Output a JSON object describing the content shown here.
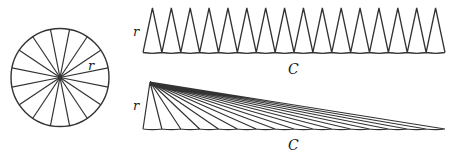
{
  "diagram": {
    "colors": {
      "stroke": "#333333",
      "background": "#ffffff",
      "label": "#222222"
    },
    "circle": {
      "sector_count": 16,
      "radius_label": "r"
    },
    "unrolled_sectors": {
      "sector_count": 16,
      "height_label": "r",
      "base_label": "C"
    },
    "sheared_sectors": {
      "sector_count": 16,
      "height_label": "r",
      "base_label": "C"
    }
  }
}
